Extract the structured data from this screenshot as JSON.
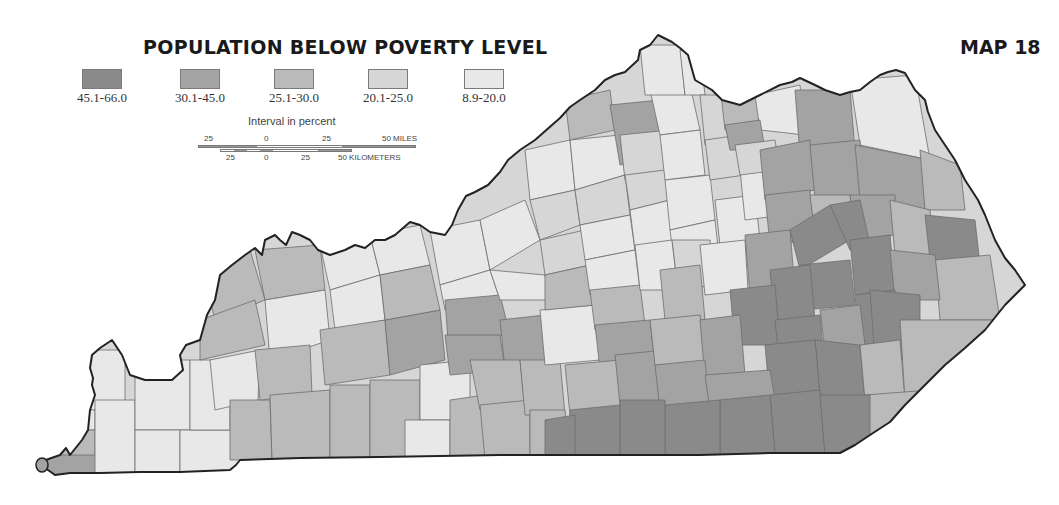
{
  "title": "POPULATION BELOW POVERTY LEVEL",
  "map_number": "MAP 18",
  "legend": {
    "items": [
      {
        "label": "45.1-66.0",
        "color": "#8a8a8a"
      },
      {
        "label": "30.1-45.0",
        "color": "#a3a3a3"
      },
      {
        "label": "25.1-30.0",
        "color": "#bababa"
      },
      {
        "label": "20.1-25.0",
        "color": "#d6d6d6"
      },
      {
        "label": "8.9-20.0",
        "color": "#e8e8e8"
      }
    ],
    "caption": "Interval in percent"
  },
  "scale_bar": {
    "miles": {
      "ticks": [
        "25",
        "0",
        "25",
        "50 MILES"
      ]
    },
    "kilometers": {
      "ticks": [
        "25",
        "0",
        "25",
        "50 KILOMETERS"
      ]
    }
  },
  "map": {
    "region": "Kentucky",
    "subdivision": "counties",
    "classes": {
      "c1": "#8a8a8a",
      "c2": "#a3a3a3",
      "c3": "#bababa",
      "c4": "#d6d6d6",
      "c5": "#e8e8e8"
    }
  }
}
